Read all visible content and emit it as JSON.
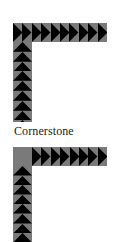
{
  "figures": [
    {
      "name": "corner-pattern-top",
      "corner": "triangle",
      "horizontal_triangles": 10,
      "vertical_triangles": 9,
      "triangle_color": "#000000",
      "frame_color": "#7a7a7a"
    },
    {
      "name": "corner-pattern-cornerstone",
      "corner": "plain-square",
      "horizontal_triangles": 8,
      "vertical_triangles": 8,
      "triangle_color": "#000000",
      "frame_color": "#7a7a7a"
    }
  ],
  "caption": "Cornerstone"
}
